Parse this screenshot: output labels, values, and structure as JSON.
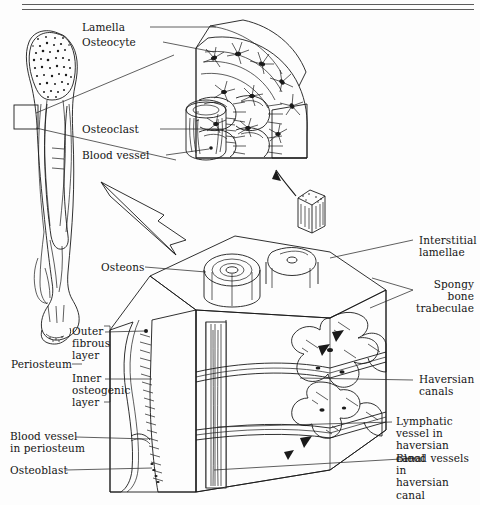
{
  "figure": {
    "background_color": "#fdfdfd",
    "ink_color": "#1a1a1a",
    "rules": {
      "count": 2,
      "note": "two horizontal rules across top of page"
    }
  },
  "labels": {
    "lamella": "Lamella",
    "osteocyte": "Osteocyte",
    "osteoclast": "Osteoclast",
    "blood_vessel": "Blood vessel",
    "osteons": "Osteons",
    "interstitial_lamellae": "Interstitial\nlamellae",
    "spongy_bone_trabeculae": "Spongy\nbone\ntrabeculae",
    "haversian_canals": "Haversian\ncanals",
    "lymphatic_vessel": "Lymphatic vessel in\nhaversian canal",
    "blood_vessels_haversian": "Blood vessels in\nhaversian canal",
    "periosteum": "Periosteum",
    "outer_fibrous_layer": "Outer\nfibrous\nlayer",
    "inner_osteogenic_layer": "Inner\nosteogenic\nlayer",
    "blood_vessel_periosteum": "Blood vessel\nin periosteum",
    "osteoblast": "Osteoblast"
  },
  "parts": {
    "femur": "long-bone-femur",
    "osteon_detail": "osteon-cutaway-block",
    "magnified_block": "compact-bone-block",
    "small_cube": "bone-sample-cube",
    "zoom_arrow": "magnification-arrow",
    "cube_arrow": "cube-callout-arrow",
    "femur_box": "femur-region-box"
  }
}
